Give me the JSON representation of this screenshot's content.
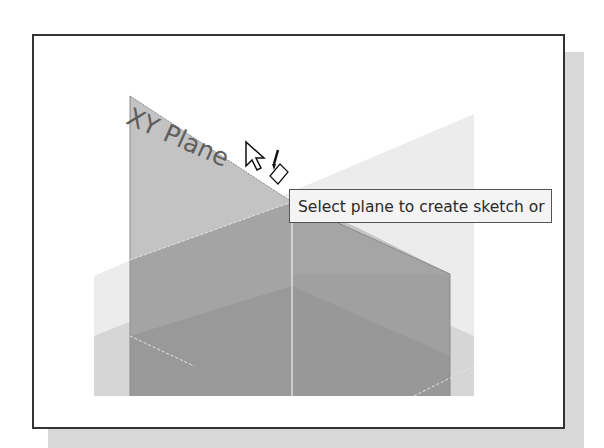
{
  "viewport": {
    "plane_label": "XY Plane",
    "tooltip_text": "Select plane to create sketch or",
    "cursor": "arrow-with-sketch-pencil-icon"
  },
  "colors": {
    "background": "#ffffff",
    "frame_border": "#333333",
    "shadow": "#d8d8d8",
    "plane_light": "#c6c6c6",
    "plane_mid": "#a4a4a4",
    "plane_dark": "#999999",
    "plane_faint": "#e6e6e6",
    "tooltip_bg": "#f4f4f4"
  }
}
